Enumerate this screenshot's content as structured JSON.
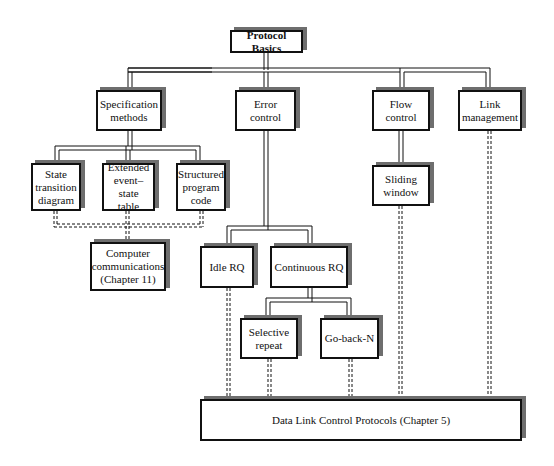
{
  "diagram": {
    "title": "Protocol Basics",
    "nodes": [
      {
        "id": "root",
        "label": "Protocol Basics"
      },
      {
        "id": "spec",
        "label": "Specification\nmethods"
      },
      {
        "id": "error",
        "label": "Error\ncontrol"
      },
      {
        "id": "flow",
        "label": "Flow\ncontrol"
      },
      {
        "id": "link",
        "label": "Link\nmanagement"
      },
      {
        "id": "std",
        "label": "State\ntransition\ndiagram"
      },
      {
        "id": "eest",
        "label": "Extended\nevent–state\ntable"
      },
      {
        "id": "spc",
        "label": "Structured\nprogram\ncode"
      },
      {
        "id": "slide",
        "label": "Sliding\nwindow"
      },
      {
        "id": "cc",
        "label": "Computer\ncommunications\n(Chapter 11)"
      },
      {
        "id": "idle",
        "label": "Idle RQ"
      },
      {
        "id": "cont",
        "label": "Continuous RQ"
      },
      {
        "id": "sel",
        "label": "Selective\nrepeat"
      },
      {
        "id": "gbn",
        "label": "Go-back-N"
      },
      {
        "id": "dlc",
        "label": "Data Link Control Protocols (Chapter 5)"
      }
    ],
    "solid_edges": [
      [
        "root",
        "spec"
      ],
      [
        "root",
        "error"
      ],
      [
        "root",
        "flow"
      ],
      [
        "root",
        "link"
      ],
      [
        "spec",
        "std"
      ],
      [
        "spec",
        "eest"
      ],
      [
        "spec",
        "spc"
      ],
      [
        "flow",
        "slide"
      ],
      [
        "error",
        "idle"
      ],
      [
        "error",
        "cont"
      ],
      [
        "cont",
        "sel"
      ],
      [
        "cont",
        "gbn"
      ]
    ],
    "dashed_edges": [
      [
        "std",
        "cc"
      ],
      [
        "eest",
        "cc"
      ],
      [
        "spc",
        "cc"
      ],
      [
        "idle",
        "dlc"
      ],
      [
        "sel",
        "dlc"
      ],
      [
        "gbn",
        "dlc"
      ],
      [
        "slide",
        "dlc"
      ],
      [
        "link",
        "dlc"
      ]
    ],
    "colors": {
      "line": "#111111",
      "shadow": "#6e6e6e",
      "background": "#ffffff"
    }
  }
}
